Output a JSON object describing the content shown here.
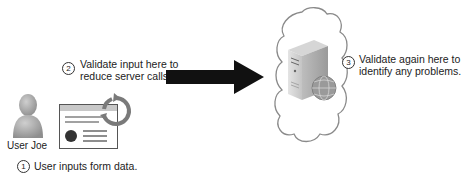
{
  "diagram": {
    "client": {
      "user_name": "User Joe",
      "step": {
        "number": "1",
        "text": "User inputs form data."
      }
    },
    "transport": {
      "step": {
        "number": "2",
        "line1": "Validate input here to",
        "line2": "reduce server calls."
      }
    },
    "server": {
      "step": {
        "number": "3",
        "line1": "Validate again here to",
        "line2": "identify any problems."
      }
    },
    "icons": {
      "user": "user-icon",
      "form": "web-form-icon",
      "refresh": "refresh-cycle-icon",
      "arrow": "right-arrow-icon",
      "cloud": "cloud-icon",
      "server": "server-icon",
      "globe": "globe-icon"
    },
    "colors": {
      "arrow": "#111111",
      "user": "#a9a9a9",
      "cloud_stroke": "#8a8a8a",
      "refresh": "#777777"
    }
  }
}
